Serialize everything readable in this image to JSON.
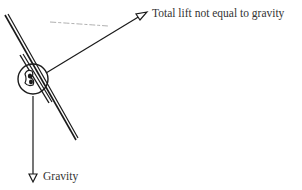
{
  "diagram": {
    "type": "force-diagram",
    "labels": {
      "lift": "Total lift not equal to gravity",
      "gravity": "Gravity"
    },
    "forces": [
      {
        "name": "lift",
        "direction": "up-right",
        "label": "Total lift not equal to gravity"
      },
      {
        "name": "gravity",
        "direction": "down",
        "label": "Gravity"
      }
    ],
    "colors": {
      "stroke": "#1a1a1a",
      "text": "#333333",
      "background": "#ffffff"
    }
  }
}
